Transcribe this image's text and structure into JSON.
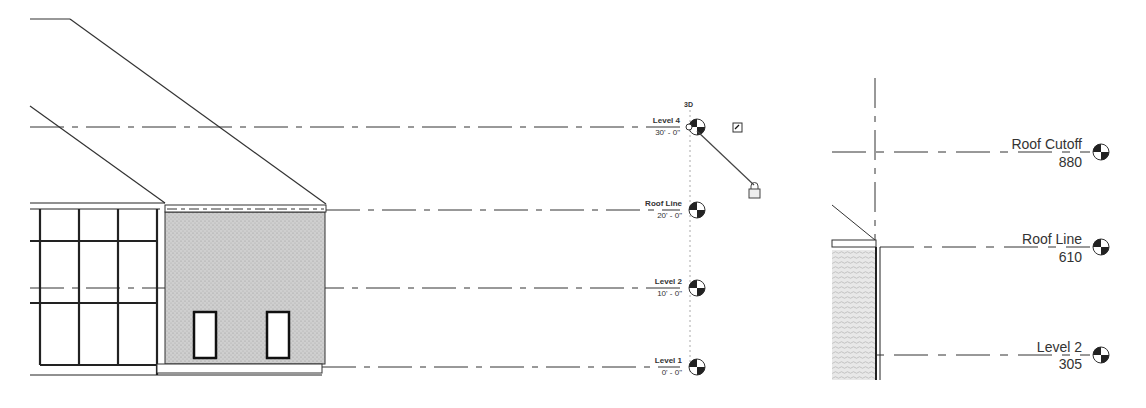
{
  "left_view": {
    "view_label": "3D",
    "levels": [
      {
        "name": "Level 4",
        "elevation": "30' - 0\""
      },
      {
        "name": "Roof Line",
        "elevation": "20' - 0\""
      },
      {
        "name": "Level 2",
        "elevation": "10' - 0\""
      },
      {
        "name": "Level 1",
        "elevation": "0' - 0\""
      }
    ]
  },
  "right_view": {
    "levels": [
      {
        "name": "Roof Cutoff",
        "elevation": "880"
      },
      {
        "name": "Roof Line",
        "elevation": "610"
      },
      {
        "name": "Level 2",
        "elevation": "305"
      }
    ]
  },
  "colors": {
    "line": "#333333",
    "hatch_fill": "#c8c8c8",
    "level_head_dark": "#222222"
  }
}
